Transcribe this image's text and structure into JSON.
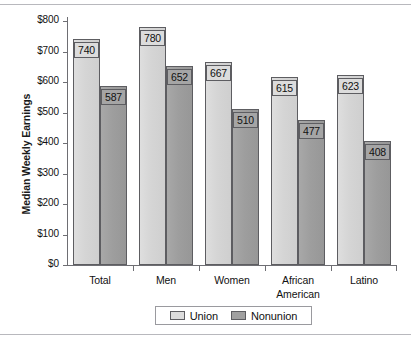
{
  "chart_data": {
    "type": "bar",
    "title": "",
    "xlabel": "",
    "ylabel": "Median Weekly Earnings",
    "categories": [
      "Total",
      "Men",
      "Women",
      "African\nAmerican",
      "Latino"
    ],
    "series": [
      {
        "name": "Union",
        "values": [
          740,
          780,
          667,
          615,
          623
        ],
        "color": "#d5d5d5"
      },
      {
        "name": "Nonunion",
        "values": [
          587,
          652,
          510,
          477,
          408
        ],
        "color": "#9e9e9e"
      }
    ],
    "ylim": [
      0,
      800
    ],
    "ytick_values": [
      0,
      100,
      200,
      300,
      400,
      500,
      600,
      700,
      800
    ],
    "ytick_labels": [
      "$0",
      "$100",
      "$200",
      "$300",
      "$400",
      "$500",
      "$600",
      "$700",
      "$800"
    ],
    "grid": false,
    "legend_position": "bottom-center",
    "value_labels_shown": true
  },
  "axis": {
    "y_title": "Median Weekly Earnings"
  },
  "legend": {
    "items": [
      {
        "label": "Union",
        "swatch": "light-gray-swatch"
      },
      {
        "label": "Nonunion",
        "swatch": "dark-gray-swatch"
      }
    ]
  },
  "colors": {
    "union_fill": "#d5d5d5",
    "nonunion_fill": "#9e9e9e",
    "bar_border": "#5d5d61",
    "axis": "#6e6e73",
    "text": "#111111",
    "rule": "#b8b8bd"
  }
}
